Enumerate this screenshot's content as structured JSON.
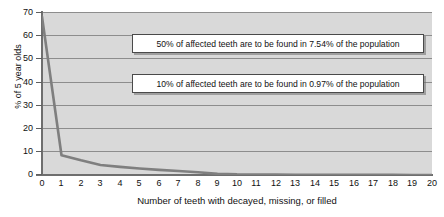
{
  "chart_data": {
    "type": "line",
    "title": "",
    "xlabel": "Number of teeth with decayed, missing, or filled",
    "ylabel": "% of 5 year olds",
    "xlim": [
      0,
      20
    ],
    "ylim": [
      0,
      70
    ],
    "grid": true,
    "legend": "none",
    "xticks": [
      "0",
      "1",
      "2",
      "3",
      "4",
      "5",
      "6",
      "7",
      "8",
      "9",
      "10",
      "11",
      "12",
      "13",
      "14",
      "15",
      "16",
      "17",
      "18",
      "19",
      "20"
    ],
    "yticks": [
      "0",
      "10",
      "20",
      "30",
      "40",
      "50",
      "60",
      "70"
    ],
    "series": [
      {
        "name": "% of 5 year olds",
        "color": "#7f7f7f",
        "x": [
          0,
          1,
          2,
          3,
          4,
          5,
          6,
          7,
          8,
          9,
          10,
          11,
          12,
          13,
          14,
          15,
          16,
          17,
          18,
          19,
          20
        ],
        "values": [
          68,
          8.5,
          6.3,
          4.3,
          3.5,
          2.8,
          2.2,
          1.7,
          1.2,
          0.5,
          0.25,
          0.2,
          0.15,
          0.12,
          0.1,
          0.08,
          0.06,
          0.05,
          0.04,
          0.03,
          0.02
        ]
      }
    ],
    "annotations": [
      {
        "text": "50% of affected teeth are to be found in 7.54% of the population"
      },
      {
        "text": "10% of affected teeth are to be found in 0.97% of the population"
      }
    ]
  }
}
